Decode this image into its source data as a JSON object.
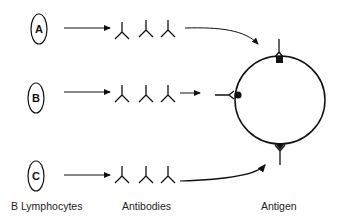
{
  "cells": [
    {
      "letter": "A",
      "name": "b-cell-a"
    },
    {
      "letter": "B",
      "name": "b-cell-b"
    },
    {
      "letter": "C",
      "name": "b-cell-c"
    }
  ],
  "labels": {
    "lymphocytes": "B Lymphocytes",
    "antibodies": "Antibodies",
    "antigen": "Antigen"
  },
  "epitopes": [
    {
      "position": "top",
      "shape": "square",
      "antibody_from": "A"
    },
    {
      "position": "left",
      "shape": "circle",
      "antibody_from": "B"
    },
    {
      "position": "bottom",
      "shape": "triangle",
      "antibody_from": "C"
    }
  ],
  "colors": {
    "stroke": "#111111",
    "text": "#222222",
    "background": "#ffffff"
  }
}
